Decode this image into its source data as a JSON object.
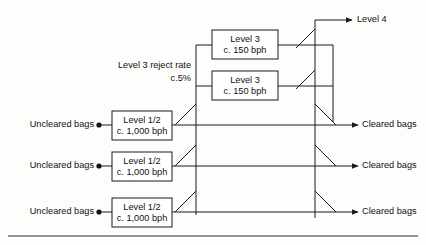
{
  "diagram": {
    "colors": {
      "line": "#1a1a1a",
      "text": "#111111",
      "box_fill": "#ffffff",
      "background": "#fdfdfc",
      "rule": "#2b2b2b"
    },
    "level3_boxes": [
      {
        "line1": "Level 3",
        "line2": "c. 150 bph"
      },
      {
        "line1": "Level 3",
        "line2": "c. 150 bph"
      }
    ],
    "level12_boxes": [
      {
        "line1": "Level 1/2",
        "line2": "c. 1,000 bph"
      },
      {
        "line1": "Level 1/2",
        "line2": "c. 1,000 bph"
      },
      {
        "line1": "Level 1/2",
        "line2": "c. 1,000 bph"
      }
    ],
    "inputs": [
      {
        "label": "Uncleared bags"
      },
      {
        "label": "Uncleared bags"
      },
      {
        "label": "Uncleared bags"
      }
    ],
    "outputs": [
      {
        "label": "Cleared bags"
      },
      {
        "label": "Cleared bags"
      },
      {
        "label": "Cleared bags"
      }
    ],
    "level4_output": {
      "label": "Level 4"
    },
    "reject_annotation": {
      "line1": "Level 3 reject rate",
      "line2": "c.5%"
    }
  }
}
